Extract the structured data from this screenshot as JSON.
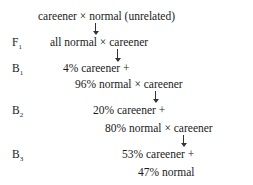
{
  "diagram": {
    "type": "breeding-cross-scheme",
    "start": "careener × normal (unrelated)",
    "generations": [
      {
        "label": "F",
        "sub": "1",
        "lines": [
          "all normal × careener"
        ]
      },
      {
        "label": "B",
        "sub": "1",
        "lines": [
          "4% careener +",
          "96% normal × careener"
        ]
      },
      {
        "label": "B",
        "sub": "2",
        "lines": [
          "20% careener +",
          "80% normal × careener"
        ]
      },
      {
        "label": "B",
        "sub": "3",
        "lines": [
          "53% careener +",
          "47% normal"
        ]
      }
    ]
  }
}
